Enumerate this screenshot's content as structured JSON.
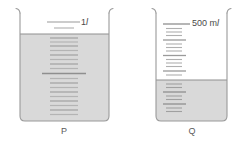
{
  "figure": {
    "title": "",
    "background_color": "#ffffff",
    "liquid_color": "#d6d6d6",
    "outline_color": "#9a9a9a",
    "tick_color": "#b0b0b0",
    "tick_color_dark": "#8f8f8f",
    "text_color": "#4a4a4a"
  },
  "beakers": [
    {
      "id": "P",
      "caption": "P",
      "scale_label": "1 l",
      "scale_label_number": "1",
      "scale_label_unit": "l",
      "fill_level_fraction": 0.93,
      "capacity_text": "1 l",
      "tick_count": 21,
      "major_tick_index": 10
    },
    {
      "id": "Q",
      "caption": "Q",
      "scale_label": "500 ml",
      "scale_label_number": "500",
      "scale_label_unit": "ml",
      "fill_level_fraction": 0.4,
      "capacity_text": "500 ml",
      "tick_count": 18,
      "major_tick_index": 0
    }
  ]
}
